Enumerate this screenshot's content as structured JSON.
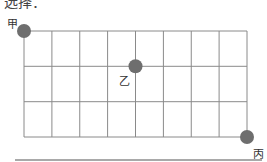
{
  "header": {
    "text": "选择："
  },
  "grid": {
    "columns": 8,
    "rows": 3,
    "left": 24,
    "top": 31,
    "right": 247,
    "bottom": 137,
    "line_color": "#8a8a8a"
  },
  "points": [
    {
      "label": "甲",
      "col": 0,
      "row": 0,
      "color": "#6e6e6e"
    },
    {
      "label": "乙",
      "col": 4,
      "row": 1,
      "color": "#6e6e6e"
    },
    {
      "label": "丙",
      "col": 8,
      "row": 3,
      "color": "#6e6e6e"
    }
  ],
  "labels": {
    "jia": "甲",
    "yi": "乙",
    "bing": "丙"
  }
}
